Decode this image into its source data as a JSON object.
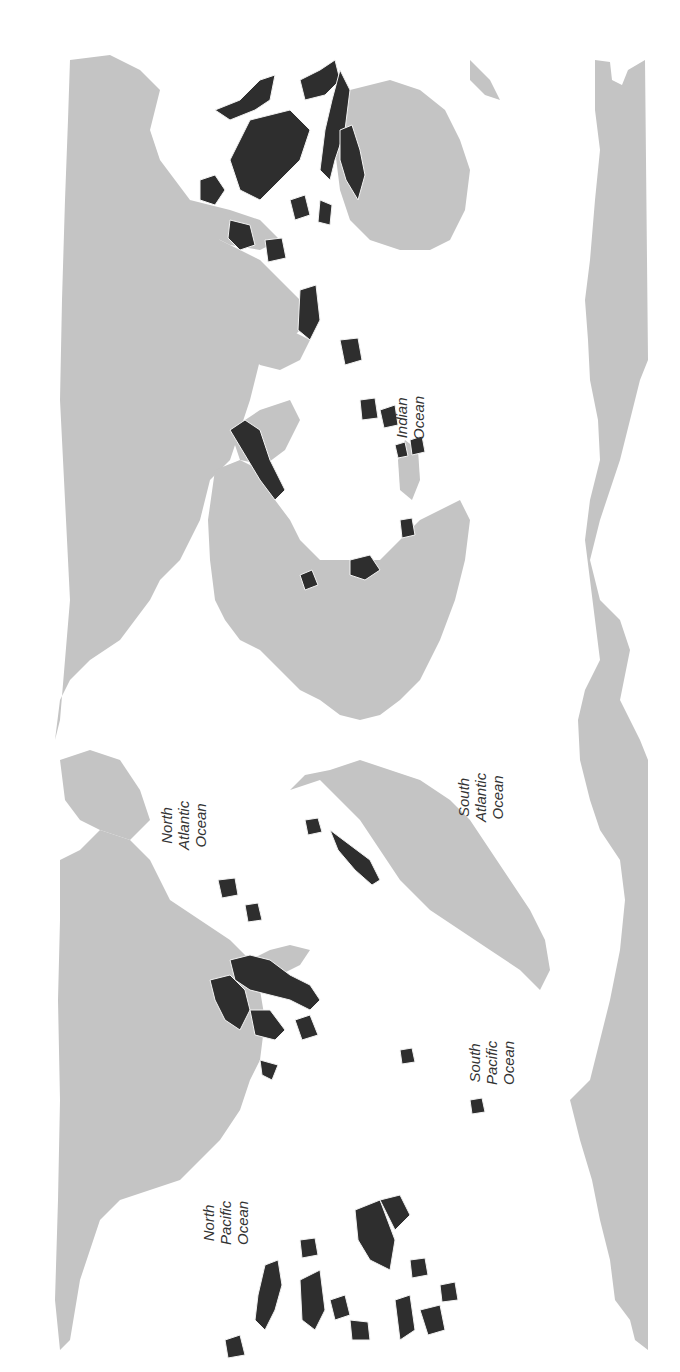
{
  "map": {
    "subject": "World distribution of coral reefs",
    "orientation": "rotated 90 degrees counter-clockwise",
    "colors": {
      "background_ocean": "#ffffff",
      "land": "#c4c4c4",
      "reef": "#2e2e2e",
      "reef_outline": "#f2f2f2",
      "label": "#333333"
    },
    "ocean_labels": [
      {
        "id": "north-pacific",
        "lines": [
          "North",
          "Pacific",
          "Ocean"
        ]
      },
      {
        "id": "south-pacific",
        "lines": [
          "South",
          "Pacific",
          "Ocean"
        ]
      },
      {
        "id": "north-atlantic",
        "lines": [
          "North",
          "Atlantic",
          "Ocean"
        ]
      },
      {
        "id": "south-atlantic",
        "lines": [
          "South",
          "Atlantic",
          "Ocean"
        ]
      },
      {
        "id": "indian",
        "lines": [
          "Indian",
          "Ocean"
        ]
      }
    ],
    "caption": ""
  }
}
